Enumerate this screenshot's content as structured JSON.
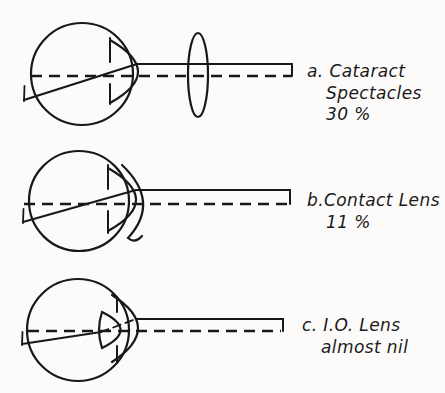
{
  "canvas": {
    "width": 445,
    "height": 393,
    "paper_color": "#fcfbf9",
    "ink_color": "#181818"
  },
  "panels": [
    {
      "letter": "a",
      "caption_lines": [
        "a. Cataract",
        "Spectacles",
        "30 %"
      ],
      "lens": "spectacle-lens"
    },
    {
      "letter": "b",
      "caption_lines": [
        "b.Contact Lens",
        "11 %"
      ],
      "lens": "contact-lens"
    },
    {
      "letter": "c",
      "caption_lines": [
        "c. I.O. Lens",
        "almost nil"
      ],
      "lens": "intraocular-lens"
    }
  ]
}
